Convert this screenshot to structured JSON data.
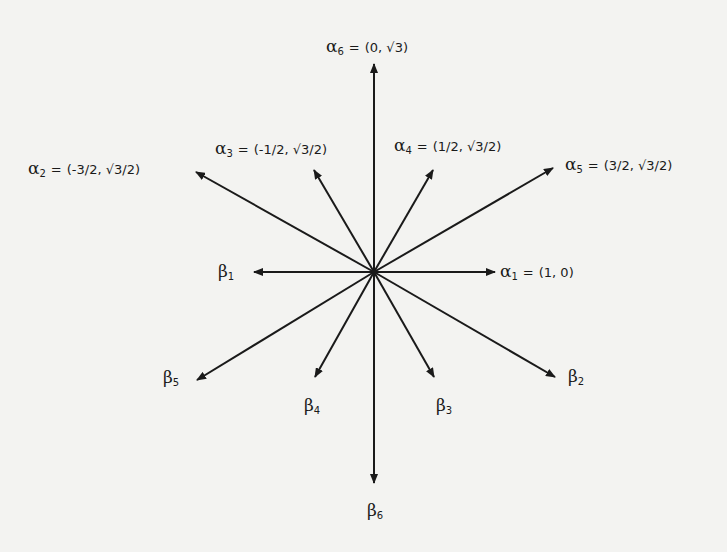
{
  "diagram": {
    "center": [
      374,
      272
    ],
    "stroke_color": "#1a1a1a",
    "background": "#f3f3f1",
    "vectors": [
      {
        "id": "alpha1",
        "symbol": "α",
        "sub": "1",
        "value": "(1, 0)",
        "tip": [
          495,
          272
        ],
        "label_pos": [
          500,
          263
        ]
      },
      {
        "id": "alpha2",
        "symbol": "α",
        "sub": "2",
        "value": "(-3/2, √3/2)",
        "tip": [
          196,
          172
        ],
        "label_pos": [
          28,
          160
        ]
      },
      {
        "id": "alpha3",
        "symbol": "α",
        "sub": "3",
        "value": "(-1/2, √3/2)",
        "tip": [
          314,
          170
        ],
        "label_pos": [
          215,
          140
        ]
      },
      {
        "id": "alpha4",
        "symbol": "α",
        "sub": "4",
        "value": "(1/2, √3/2)",
        "tip": [
          433,
          170
        ],
        "label_pos": [
          394,
          137
        ]
      },
      {
        "id": "alpha5",
        "symbol": "α",
        "sub": "5",
        "value": "(3/2, √3/2)",
        "tip": [
          553,
          168
        ],
        "label_pos": [
          565,
          156
        ]
      },
      {
        "id": "alpha6",
        "symbol": "α",
        "sub": "6",
        "value": "(0, √3)",
        "tip": [
          374,
          64
        ],
        "label_pos": [
          326,
          38
        ]
      },
      {
        "id": "beta1",
        "symbol": "β",
        "sub": "1",
        "value": "",
        "tip": [
          254,
          272
        ],
        "label_pos": [
          218,
          263
        ]
      },
      {
        "id": "beta2",
        "symbol": "β",
        "sub": "2",
        "value": "",
        "tip": [
          555,
          377
        ],
        "label_pos": [
          568,
          368
        ]
      },
      {
        "id": "beta3",
        "symbol": "β",
        "sub": "3",
        "value": "",
        "tip": [
          434,
          377
        ],
        "label_pos": [
          436,
          397
        ]
      },
      {
        "id": "beta4",
        "symbol": "β",
        "sub": "4",
        "value": "",
        "tip": [
          315,
          377
        ],
        "label_pos": [
          304,
          397
        ]
      },
      {
        "id": "beta5",
        "symbol": "β",
        "sub": "5",
        "value": "",
        "tip": [
          197,
          380
        ],
        "label_pos": [
          163,
          369
        ]
      },
      {
        "id": "beta6",
        "symbol": "β",
        "sub": "6",
        "value": "",
        "tip": [
          374,
          483
        ],
        "label_pos": [
          367,
          502
        ]
      }
    ]
  }
}
